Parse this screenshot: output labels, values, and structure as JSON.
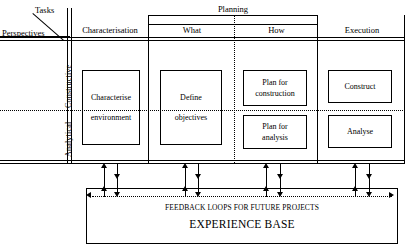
{
  "diagram": {
    "axis_labels": {
      "tasks": "Tasks",
      "perspectives": "Perspectives"
    },
    "group_headers": [
      {
        "id": "planning",
        "label": "Planning"
      }
    ],
    "columns": [
      {
        "id": "characterisation",
        "label": "Characterisation"
      },
      {
        "id": "what",
        "label": "What"
      },
      {
        "id": "how",
        "label": "How"
      },
      {
        "id": "execution",
        "label": "Execution"
      }
    ],
    "rows": [
      {
        "id": "constructive",
        "label": "Constructive"
      },
      {
        "id": "analytical",
        "label": "Analytical"
      }
    ],
    "cells": [
      {
        "id": "characterise-environment",
        "column": "characterisation",
        "span_rows": true,
        "line1": "Characterise",
        "line2": "environment"
      },
      {
        "id": "define-objectives",
        "column": "what",
        "span_rows": true,
        "line1": "Define",
        "line2": "objectives"
      },
      {
        "id": "plan-for-construction",
        "column": "how",
        "row": "constructive",
        "line1": "Plan for",
        "line2": "construction"
      },
      {
        "id": "plan-for-analysis",
        "column": "how",
        "row": "analytical",
        "line1": "Plan for",
        "line2": "analysis"
      },
      {
        "id": "construct",
        "column": "execution",
        "row": "constructive",
        "line1": "Construct",
        "line2": ""
      },
      {
        "id": "analyse",
        "column": "execution",
        "row": "analytical",
        "line1": "Analyse",
        "line2": ""
      }
    ],
    "experience_base": {
      "feedback_label": "FEEDBACK LOOPS FOR FUTURE PROJECTS",
      "title": "EXPERIENCE BASE"
    },
    "colors": {
      "stroke": "#000000",
      "background": "#ffffff"
    }
  }
}
